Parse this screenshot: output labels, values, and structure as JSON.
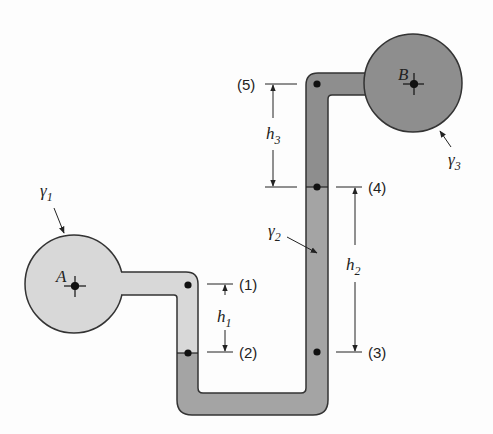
{
  "diagram": {
    "type": "manometer",
    "colors": {
      "fluid_1": "#d8d8d8",
      "fluid_2": "#a4a4a4",
      "fluid_3": "#8e8e8e",
      "outline": "#333333",
      "background": "#fdfdfd"
    },
    "vessels": [
      {
        "id": "A",
        "label": "A",
        "fluid": "γ1"
      },
      {
        "id": "B",
        "label": "B",
        "fluid": "γ3"
      }
    ],
    "fluids": [
      {
        "symbol": "γ",
        "subscript": "1"
      },
      {
        "symbol": "γ",
        "subscript": "2"
      },
      {
        "symbol": "γ",
        "subscript": "3"
      }
    ],
    "points": [
      {
        "label": "(1)"
      },
      {
        "label": "(2)"
      },
      {
        "label": "(3)"
      },
      {
        "label": "(4)"
      },
      {
        "label": "(5)"
      }
    ],
    "heights": [
      {
        "symbol": "h",
        "subscript": "1"
      },
      {
        "symbol": "h",
        "subscript": "2"
      },
      {
        "symbol": "h",
        "subscript": "3"
      }
    ]
  }
}
